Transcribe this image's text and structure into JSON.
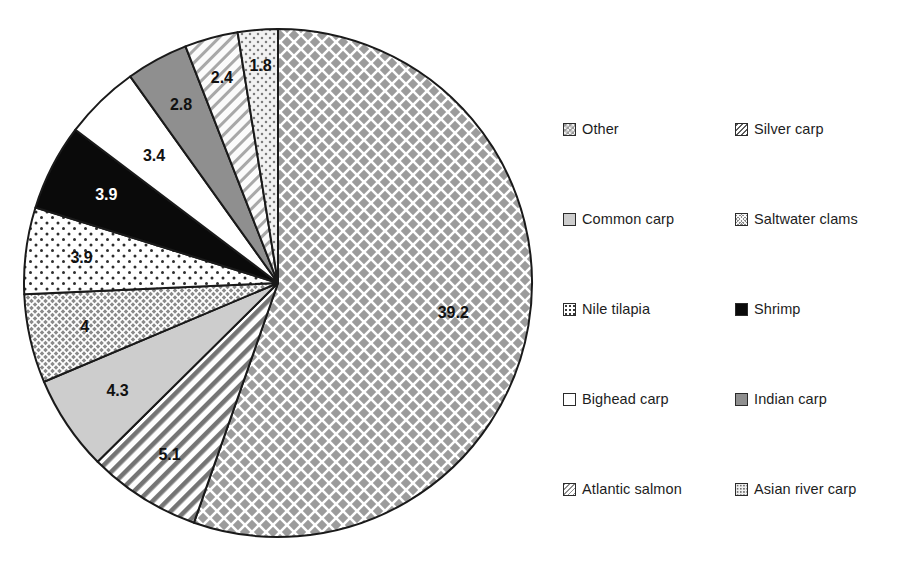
{
  "chart_data": {
    "type": "pie",
    "title": "",
    "subtitle": "",
    "xlabel": "",
    "ylabel": "",
    "units": "million tonnes",
    "start_angle_deg": 0,
    "direction": "clockwise",
    "grid": false,
    "legend_position": "right",
    "legend_columns": 2,
    "labels_inside_slices": true,
    "categories": [
      "Other",
      "Silver carp",
      "Common carp",
      "Saltwater clams",
      "Nile tilapia",
      "Shrimp",
      "Bighead carp",
      "Indian carp",
      "Atlantic salmon",
      "Asian river carp"
    ],
    "values": [
      39.2,
      5.1,
      4.3,
      4,
      3.9,
      3.9,
      3.4,
      2.8,
      2.4,
      1.8
    ],
    "value_labels": [
      "39.2",
      "5.1",
      "4.3",
      "4",
      "3.9",
      "3.9",
      "3.4",
      "2.8",
      "2.4",
      "1.8"
    ],
    "slices": [
      {
        "label": "Other",
        "value": 39.2,
        "value_label": "39.2",
        "pattern": "diamond-crosshatch",
        "fill": "#9c9c9c",
        "label_color": "#111111"
      },
      {
        "label": "Silver carp",
        "value": 5.1,
        "value_label": "5.1",
        "pattern": "diagonal-stripes",
        "fill": "#f2f2f2",
        "label_color": "#111111"
      },
      {
        "label": "Common carp",
        "value": 4.3,
        "value_label": "4.3",
        "pattern": "solid",
        "fill": "#cdcdcd",
        "label_color": "#111111"
      },
      {
        "label": "Saltwater clams",
        "value": 4,
        "value_label": "4",
        "pattern": "fine-crosshatch",
        "fill": "#8a8a8a",
        "label_color": "#111111"
      },
      {
        "label": "Nile tilapia",
        "value": 3.9,
        "value_label": "3.9",
        "pattern": "dots",
        "fill": "#ffffff",
        "label_color": "#111111"
      },
      {
        "label": "Shrimp",
        "value": 3.9,
        "value_label": "3.9",
        "pattern": "solid",
        "fill": "#0a0a0a",
        "label_color": "#ffffff"
      },
      {
        "label": "Bighead carp",
        "value": 3.4,
        "value_label": "3.4",
        "pattern": "solid",
        "fill": "#ffffff",
        "label_color": "#111111"
      },
      {
        "label": "Indian carp",
        "value": 2.8,
        "value_label": "2.8",
        "pattern": "solid",
        "fill": "#8f8f8f",
        "label_color": "#111111"
      },
      {
        "label": "Atlantic salmon",
        "value": 2.4,
        "value_label": "2.4",
        "pattern": "light-diagonal",
        "fill": "#f4f4f4",
        "label_color": "#111111"
      },
      {
        "label": "Asian river carp",
        "value": 1.8,
        "value_label": "1.8",
        "pattern": "light-dots",
        "fill": "#efefef",
        "label_color": "#111111"
      }
    ]
  },
  "legend": {
    "rows": [
      {
        "left": {
          "label": "Other",
          "swatch": "sw-other"
        },
        "right": {
          "label": "Silver carp",
          "swatch": "sw-silver"
        }
      },
      {
        "left": {
          "label": "Common carp",
          "swatch": "sw-common"
        },
        "right": {
          "label": "Saltwater clams",
          "swatch": "sw-saltwater"
        }
      },
      {
        "left": {
          "label": "Nile tilapia",
          "swatch": "sw-nile"
        },
        "right": {
          "label": "Shrimp",
          "swatch": "sw-shrimp"
        }
      },
      {
        "left": {
          "label": "Bighead carp",
          "swatch": "sw-bighead"
        },
        "right": {
          "label": "Indian carp",
          "swatch": "sw-indian"
        }
      },
      {
        "left": {
          "label": "Atlantic salmon",
          "swatch": "sw-atlantic"
        },
        "right": {
          "label": "Asian river carp",
          "swatch": "sw-asian"
        }
      }
    ]
  },
  "style": {
    "background": "#ffffff",
    "outline": "#1a1a1a",
    "text": "#1d1d1d"
  }
}
